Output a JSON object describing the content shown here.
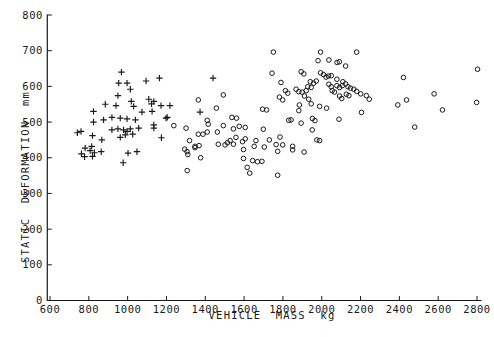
{
  "figure": {
    "background_color": "#ffffff",
    "ink_color": "#1a1a1a"
  },
  "chart_data": {
    "type": "scatter",
    "title": "",
    "xlabel": "VEHICLE MASS kg",
    "ylabel": "STATIC DEFORMATION mm",
    "xlim": [
      600,
      2800
    ],
    "ylim": [
      0,
      800
    ],
    "xticks": [
      600,
      800,
      1000,
      1200,
      1400,
      1600,
      1800,
      2000,
      2200,
      2400,
      2600,
      2800
    ],
    "yticks": [
      0,
      100,
      200,
      300,
      400,
      500,
      600,
      700,
      800
    ],
    "grid": false,
    "legend": "none",
    "series": [
      {
        "name": "plus-markers",
        "marker": "plus",
        "points": [
          [
            968,
            640
          ],
          [
            1095,
            615
          ],
          [
            1164,
            623
          ],
          [
            1440,
            623
          ],
          [
            954,
            609
          ],
          [
            997,
            609
          ],
          [
            1014,
            592
          ],
          [
            950,
            574
          ],
          [
            1109,
            564
          ],
          [
            1135,
            558
          ],
          [
            1123,
            551
          ],
          [
            1172,
            546
          ],
          [
            1218,
            546
          ],
          [
            885,
            550
          ],
          [
            940,
            546
          ],
          [
            1019,
            558
          ],
          [
            1031,
            544
          ],
          [
            824,
            530
          ],
          [
            1074,
            528
          ],
          [
            1126,
            530
          ],
          [
            1373,
            528
          ],
          [
            824,
            500
          ],
          [
            876,
            506
          ],
          [
            919,
            513
          ],
          [
            962,
            511
          ],
          [
            997,
            509
          ],
          [
            1040,
            506
          ],
          [
            1198,
            511
          ],
          [
            1204,
            513
          ],
          [
            919,
            478
          ],
          [
            950,
            481
          ],
          [
            979,
            478
          ],
          [
            997,
            474
          ],
          [
            1014,
            481
          ],
          [
            760,
            474
          ],
          [
            741,
            470
          ],
          [
            962,
            457
          ],
          [
            988,
            464
          ],
          [
            1026,
            466
          ],
          [
            1057,
            483
          ],
          [
            1135,
            483
          ],
          [
            1174,
            456
          ],
          [
            1135,
            492
          ],
          [
            819,
            462
          ],
          [
            867,
            450
          ],
          [
            781,
            427
          ],
          [
            815,
            432
          ],
          [
            829,
            414
          ],
          [
            864,
            417
          ],
          [
            807,
            420
          ],
          [
            762,
            411
          ],
          [
            778,
            403
          ],
          [
            819,
            404
          ],
          [
            1002,
            413
          ],
          [
            1048,
            417
          ],
          [
            977,
            386
          ]
        ]
      },
      {
        "name": "circle-markers",
        "marker": "circle",
        "points": [
          [
            1751,
            696
          ],
          [
            1994,
            696
          ],
          [
            2180,
            696
          ],
          [
            1981,
            672
          ],
          [
            2037,
            674
          ],
          [
            2079,
            667
          ],
          [
            2091,
            669
          ],
          [
            2123,
            657
          ],
          [
            1744,
            637
          ],
          [
            1894,
            641
          ],
          [
            1908,
            635
          ],
          [
            1994,
            638
          ],
          [
            2009,
            633
          ],
          [
            2022,
            626
          ],
          [
            2035,
            629
          ],
          [
            2049,
            630
          ],
          [
            2078,
            620
          ],
          [
            1790,
            611
          ],
          [
            1941,
            613
          ],
          [
            1958,
            609
          ],
          [
            1972,
            615
          ],
          [
            1928,
            599
          ],
          [
            1946,
            597
          ],
          [
            2037,
            606
          ],
          [
            2049,
            599
          ],
          [
            2078,
            602
          ],
          [
            2092,
            597
          ],
          [
            2106,
            602
          ],
          [
            2109,
            613
          ],
          [
            2123,
            607
          ],
          [
            2135,
            599
          ],
          [
            2148,
            595
          ],
          [
            2165,
            592
          ],
          [
            2180,
            586
          ],
          [
            1813,
            588
          ],
          [
            1825,
            581
          ],
          [
            1868,
            592
          ],
          [
            1882,
            585
          ],
          [
            1920,
            588
          ],
          [
            1899,
            584
          ],
          [
            1911,
            573
          ],
          [
            1933,
            564
          ],
          [
            2054,
            588
          ],
          [
            2066,
            584
          ],
          [
            2127,
            578
          ],
          [
            2140,
            574
          ],
          [
            2092,
            573
          ],
          [
            2103,
            566
          ],
          [
            2201,
            579
          ],
          [
            2230,
            574
          ],
          [
            2245,
            564
          ],
          [
            1782,
            570
          ],
          [
            1799,
            562
          ],
          [
            1885,
            548
          ],
          [
            1989,
            544
          ],
          [
            2025,
            539
          ],
          [
            1946,
            551
          ],
          [
            1695,
            536
          ],
          [
            1716,
            534
          ],
          [
            1882,
            532
          ],
          [
            2205,
            527
          ],
          [
            1830,
            505
          ],
          [
            1842,
            506
          ],
          [
            1952,
            510
          ],
          [
            1965,
            504
          ],
          [
            2089,
            508
          ],
          [
            1894,
            497
          ],
          [
            1951,
            478
          ],
          [
            1699,
            480
          ],
          [
            1730,
            450
          ],
          [
            1785,
            458
          ],
          [
            1799,
            436
          ],
          [
            1773,
            418
          ],
          [
            1850,
            432
          ],
          [
            1850,
            422
          ],
          [
            1909,
            416
          ],
          [
            1975,
            450
          ],
          [
            1989,
            448
          ],
          [
            1692,
            390
          ],
          [
            1773,
            351
          ],
          [
            1644,
            392
          ],
          [
            1669,
            389
          ],
          [
            1597,
            398
          ],
          [
            1616,
            373
          ],
          [
            1629,
            357
          ],
          [
            1514,
            442
          ],
          [
            1528,
            448
          ],
          [
            1502,
            436
          ],
          [
            1592,
            445
          ],
          [
            1606,
            453
          ],
          [
            1597,
            423
          ],
          [
            1661,
            448
          ],
          [
            1704,
            430
          ],
          [
            1765,
            437
          ],
          [
            1545,
            438
          ],
          [
            1558,
            457
          ],
          [
            1652,
            432
          ],
          [
            1307,
            364
          ],
          [
            1294,
            424
          ],
          [
            1306,
            417
          ],
          [
            1310,
            409
          ],
          [
            1347,
            428
          ],
          [
            1376,
            400
          ],
          [
            1238,
            490
          ],
          [
            1301,
            483
          ],
          [
            1319,
            448
          ],
          [
            1347,
            432
          ],
          [
            1368,
            434
          ],
          [
            1364,
            466
          ],
          [
            1388,
            466
          ],
          [
            1410,
            472
          ],
          [
            1462,
            472
          ],
          [
            1493,
            490
          ],
          [
            1467,
            438
          ],
          [
            1364,
            562
          ],
          [
            1493,
            576
          ],
          [
            1457,
            539
          ],
          [
            1410,
            505
          ],
          [
            1415,
            494
          ],
          [
            1537,
            513
          ],
          [
            1561,
            511
          ],
          [
            1575,
            488
          ],
          [
            1545,
            481
          ],
          [
            1606,
            485
          ],
          [
            2392,
            548
          ],
          [
            2437,
            562
          ],
          [
            2421,
            625
          ],
          [
            2579,
            579
          ],
          [
            2622,
            534
          ],
          [
            2479,
            486
          ],
          [
            2803,
            648
          ],
          [
            2798,
            555
          ]
        ]
      }
    ]
  }
}
